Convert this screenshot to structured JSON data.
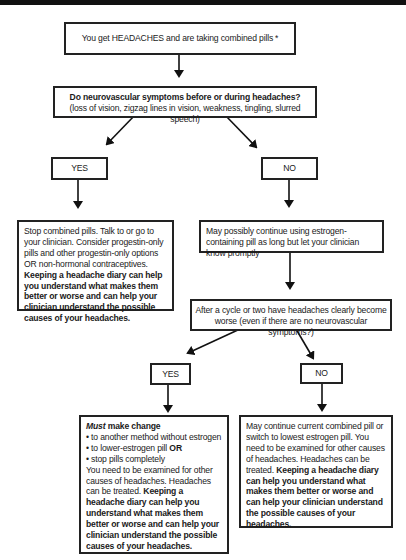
{
  "flowchart": {
    "start": {
      "text": "You get HEADACHES and are taking combined pills",
      "asterisk": "*"
    },
    "question1": {
      "title": "Do neurovascular symptoms before or during headaches?",
      "subtitle": "(loss of vision, zigzag lines in vision, weakness, tingling, slurred speech)"
    },
    "q1_yes": {
      "label": "YES",
      "outcome": {
        "plain": "Stop combined pills. Talk to or go to your clinician. Consider progestin-only pills and other progestin-only options OR non-hormonal contraceptives.",
        "bold": "Keeping a headache diary can help you understand what makes them better or worse and can help your clinician understand the possible causes of your headaches."
      }
    },
    "q1_no": {
      "label": "NO",
      "outcome": "May possibly continue using estrogen-containing pill as long but let your clinician know promptly"
    },
    "question2": {
      "text": "After a cycle or two have headaches clearly become worse (even if there are no neurovascular symptoms?)"
    },
    "q2_yes": {
      "label": "YES",
      "outcome": {
        "heading_italic": "Must",
        "heading_rest": " make change",
        "options": [
          "to another method without estrogen",
          "to lower-estrogen pill",
          "stop pills completely"
        ],
        "option2_suffix": "OR",
        "plain": "You need to be examined for other causes of headaches. Headaches can be treated.",
        "bold": "Keeping a headache diary can help you understand what makes them better or worse and can help your clinician understand the possible causes of your headaches."
      }
    },
    "q2_no": {
      "label": "NO",
      "outcome": {
        "plain": "May continue current combined pill or switch to lowest estrogen pill. You need to be examined for other causes of headaches. Headaches can be treated.",
        "bold": "Keeping a headache diary can help you understand what makes them better or worse and can help your clinician understand the possible causes of your headaches."
      }
    }
  }
}
